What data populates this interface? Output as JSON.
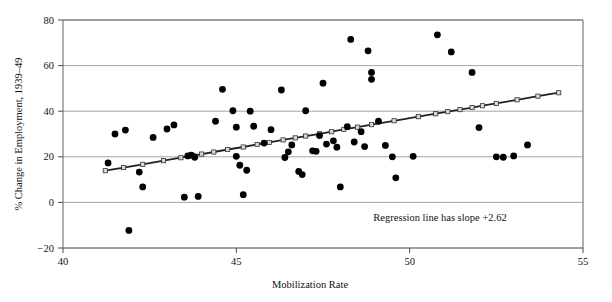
{
  "chart_data": {
    "type": "scatter",
    "title": "",
    "xlabel": "Mobilization Rate",
    "ylabel": "% Change in Employment, 1939–49",
    "xlim": [
      40,
      55
    ],
    "ylim": [
      -20,
      80
    ],
    "xticks": [
      40,
      45,
      50,
      55
    ],
    "xtick_labels": [
      "40",
      "45",
      "50",
      "55"
    ],
    "yticks": [
      -20,
      0,
      20,
      40,
      60,
      80
    ],
    "ytick_labels": [
      "−20",
      "0",
      "20",
      "40",
      "60",
      "80"
    ],
    "grid": "horizontal",
    "legend": "none",
    "annotations": [
      {
        "text": "Regression line has slope +2.62",
        "x": 50.6,
        "y": -7.5
      }
    ],
    "series": [
      {
        "name": "states",
        "type": "scatter",
        "marker": "filled-circle",
        "color": "#000000",
        "points": [
          [
            41.3,
            17.3
          ],
          [
            41.5,
            30.0
          ],
          [
            41.8,
            31.7
          ],
          [
            41.9,
            -12.3
          ],
          [
            42.2,
            13.3
          ],
          [
            42.3,
            6.8
          ],
          [
            42.6,
            28.5
          ],
          [
            43.0,
            32.2
          ],
          [
            43.2,
            34.0
          ],
          [
            43.5,
            2.3
          ],
          [
            43.6,
            20.4
          ],
          [
            43.7,
            20.7
          ],
          [
            43.8,
            19.8
          ],
          [
            43.9,
            2.6
          ],
          [
            44.4,
            35.6
          ],
          [
            44.6,
            49.6
          ],
          [
            44.9,
            40.2
          ],
          [
            45.0,
            20.2
          ],
          [
            45.0,
            33.0
          ],
          [
            45.1,
            16.3
          ],
          [
            45.2,
            3.4
          ],
          [
            45.3,
            14.1
          ],
          [
            45.4,
            40.0
          ],
          [
            45.5,
            33.4
          ],
          [
            45.8,
            26.0
          ],
          [
            46.0,
            31.9
          ],
          [
            46.3,
            49.3
          ],
          [
            46.4,
            19.7
          ],
          [
            46.5,
            22.2
          ],
          [
            46.6,
            25.2
          ],
          [
            46.8,
            13.6
          ],
          [
            46.9,
            12.2
          ],
          [
            47.0,
            40.2
          ],
          [
            47.2,
            22.6
          ],
          [
            47.3,
            22.4
          ],
          [
            47.4,
            29.3
          ],
          [
            47.5,
            52.3
          ],
          [
            47.6,
            25.6
          ],
          [
            47.8,
            27.0
          ],
          [
            47.9,
            24.2
          ],
          [
            48.0,
            6.8
          ],
          [
            48.2,
            33.2
          ],
          [
            48.3,
            71.5
          ],
          [
            48.4,
            26.5
          ],
          [
            48.6,
            31.0
          ],
          [
            48.7,
            24.5
          ],
          [
            48.8,
            66.5
          ],
          [
            48.9,
            54.0
          ],
          [
            48.9,
            57.0
          ],
          [
            49.1,
            35.6
          ],
          [
            49.3,
            25.0
          ],
          [
            49.5,
            20.0
          ],
          [
            49.6,
            10.8
          ],
          [
            50.1,
            20.2
          ],
          [
            50.8,
            73.5
          ],
          [
            51.2,
            66.0
          ],
          [
            51.8,
            57.0
          ],
          [
            52.0,
            32.8
          ],
          [
            52.5,
            20.0
          ],
          [
            52.7,
            19.8
          ],
          [
            53.0,
            20.4
          ],
          [
            53.4,
            25.2
          ]
        ]
      },
      {
        "name": "regression-line",
        "type": "line",
        "marker": "open-square",
        "color": "#222222",
        "slope": 2.62,
        "points": [
          [
            41.22,
            13.9
          ],
          [
            41.75,
            15.3
          ],
          [
            42.3,
            16.7
          ],
          [
            42.9,
            18.3
          ],
          [
            43.4,
            19.6
          ],
          [
            43.75,
            20.6
          ],
          [
            44.0,
            21.2
          ],
          [
            44.35,
            22.1
          ],
          [
            44.75,
            23.2
          ],
          [
            45.2,
            24.3
          ],
          [
            45.6,
            25.4
          ],
          [
            45.95,
            26.3
          ],
          [
            46.35,
            27.4
          ],
          [
            46.7,
            28.3
          ],
          [
            47.0,
            29.1
          ],
          [
            47.4,
            30.1
          ],
          [
            47.75,
            31.0
          ],
          [
            48.1,
            32.0
          ],
          [
            48.5,
            33.0
          ],
          [
            48.9,
            34.1
          ],
          [
            49.55,
            35.8
          ],
          [
            50.25,
            37.6
          ],
          [
            50.75,
            38.9
          ],
          [
            51.1,
            39.8
          ],
          [
            51.45,
            40.7
          ],
          [
            51.8,
            41.6
          ],
          [
            52.1,
            42.4
          ],
          [
            52.5,
            43.4
          ],
          [
            53.1,
            45.0
          ],
          [
            53.7,
            46.6
          ],
          [
            54.3,
            48.1
          ]
        ]
      }
    ]
  },
  "axes_geometry": {
    "plot_left": 63,
    "plot_right": 583,
    "plot_top": 20,
    "plot_bottom": 248
  }
}
